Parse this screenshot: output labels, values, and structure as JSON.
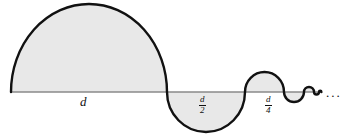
{
  "figure": {
    "background_color": "#ffffff",
    "fill_color": "#e8e8e8",
    "stroke_color": "#111111",
    "baseline_color": "#888888",
    "baseline": {
      "y": 92,
      "x_start": 11,
      "x_end": 322
    },
    "labels": {
      "first": "d",
      "second_numerator": "d",
      "second_denominator": "2",
      "third_numerator": "d",
      "third_denominator": "4",
      "ellipsis": "..."
    },
    "lobes": [
      {
        "name": "lobe-1",
        "x_start": 11,
        "x_end": 167,
        "diameter": 156,
        "direction": "up",
        "label": "d"
      },
      {
        "name": "lobe-2",
        "x_start": 167,
        "x_end": 245,
        "diameter": 78,
        "direction": "down",
        "label": "d/2"
      },
      {
        "name": "lobe-3",
        "x_start": 245,
        "x_end": 284,
        "diameter": 39,
        "direction": "up",
        "label": "d/4"
      },
      {
        "name": "lobe-4",
        "x_start": 284,
        "x_end": 304,
        "diameter": 20,
        "direction": "down",
        "label": ""
      },
      {
        "name": "lobe-5",
        "x_start": 304,
        "x_end": 314,
        "diameter": 10,
        "direction": "up",
        "label": ""
      },
      {
        "name": "lobe-6",
        "x_start": 314,
        "x_end": 319,
        "diameter": 5,
        "direction": "down",
        "label": ""
      },
      {
        "name": "lobe-7",
        "x_start": 319,
        "x_end": 321,
        "diameter": 2,
        "direction": "up",
        "label": ""
      }
    ]
  }
}
